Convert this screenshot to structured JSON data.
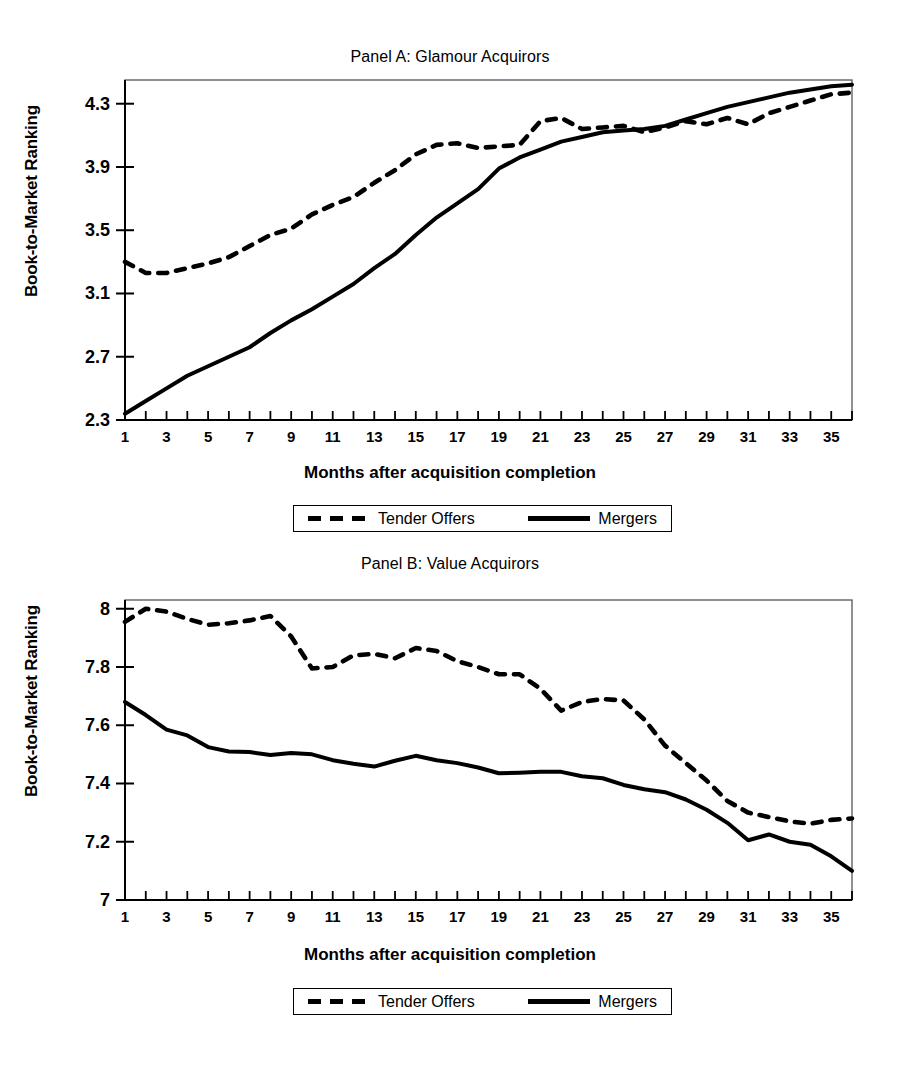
{
  "figure": {
    "legend": {
      "tender_label": "Tender Offers",
      "mergers_label": "Mergers"
    }
  },
  "chart_data": [
    {
      "type": "line",
      "panel": "A",
      "title": "Panel A: Glamour Acquirors",
      "xlabel": "Months after acquisition completion",
      "ylabel": "Book-to-Market Ranking",
      "xlim": [
        1,
        36
      ],
      "ylim": [
        2.3,
        4.45
      ],
      "yticks": [
        2.3,
        2.7,
        3.1,
        3.5,
        3.9,
        4.3
      ],
      "ytick_labels": [
        "2.3",
        "2.7",
        "3.1",
        "3.5",
        "3.9",
        "4.3"
      ],
      "xticks": [
        1,
        2,
        3,
        4,
        5,
        6,
        7,
        8,
        9,
        10,
        11,
        12,
        13,
        14,
        15,
        16,
        17,
        18,
        19,
        20,
        21,
        22,
        23,
        24,
        25,
        26,
        27,
        28,
        29,
        30,
        31,
        32,
        33,
        34,
        35,
        36
      ],
      "xtick_labels": [
        "1",
        "",
        "3",
        "",
        "5",
        "",
        "7",
        "",
        "9",
        "",
        "11",
        "",
        "13",
        "",
        "15",
        "",
        "17",
        "",
        "19",
        "",
        "21",
        "",
        "23",
        "",
        "25",
        "",
        "27",
        "",
        "29",
        "",
        "31",
        "",
        "33",
        "",
        "35",
        ""
      ],
      "grid": false,
      "legend_position": "below",
      "x": [
        1,
        2,
        3,
        4,
        5,
        6,
        7,
        8,
        9,
        10,
        11,
        12,
        13,
        14,
        15,
        16,
        17,
        18,
        19,
        20,
        21,
        22,
        23,
        24,
        25,
        26,
        27,
        28,
        29,
        30,
        31,
        32,
        33,
        34,
        35,
        36
      ],
      "series": [
        {
          "name": "Tender Offers",
          "style": "dashed",
          "values": [
            3.3,
            3.23,
            3.23,
            3.26,
            3.29,
            3.33,
            3.4,
            3.47,
            3.51,
            3.6,
            3.66,
            3.71,
            3.8,
            3.88,
            3.98,
            4.04,
            4.05,
            4.02,
            4.03,
            4.04,
            4.19,
            4.21,
            4.14,
            4.15,
            4.16,
            4.12,
            4.15,
            4.19,
            4.17,
            4.21,
            4.17,
            4.24,
            4.28,
            4.32,
            4.36,
            4.37
          ]
        },
        {
          "name": "Mergers",
          "style": "solid",
          "values": [
            2.34,
            2.42,
            2.5,
            2.58,
            2.64,
            2.7,
            2.76,
            2.85,
            2.93,
            3.0,
            3.08,
            3.16,
            3.26,
            3.35,
            3.47,
            3.58,
            3.67,
            3.76,
            3.89,
            3.96,
            4.01,
            4.06,
            4.09,
            4.12,
            4.13,
            4.14,
            4.16,
            4.2,
            4.24,
            4.28,
            4.31,
            4.34,
            4.37,
            4.39,
            4.41,
            4.42
          ]
        }
      ]
    },
    {
      "type": "line",
      "panel": "B",
      "title": "Panel B: Value Acquirors",
      "xlabel": "Months after acquisition completion",
      "ylabel": "Book-to-Market Ranking",
      "xlim": [
        1,
        36
      ],
      "ylim": [
        7.0,
        8.03
      ],
      "yticks": [
        7.0,
        7.2,
        7.4,
        7.6,
        7.8,
        8.0
      ],
      "ytick_labels": [
        "7",
        "7.2",
        "7.4",
        "7.6",
        "7.8",
        "8"
      ],
      "xticks": [
        1,
        2,
        3,
        4,
        5,
        6,
        7,
        8,
        9,
        10,
        11,
        12,
        13,
        14,
        15,
        16,
        17,
        18,
        19,
        20,
        21,
        22,
        23,
        24,
        25,
        26,
        27,
        28,
        29,
        30,
        31,
        32,
        33,
        34,
        35,
        36
      ],
      "xtick_labels": [
        "1",
        "",
        "3",
        "",
        "5",
        "",
        "7",
        "",
        "9",
        "",
        "11",
        "",
        "13",
        "",
        "15",
        "",
        "17",
        "",
        "19",
        "",
        "21",
        "",
        "23",
        "",
        "25",
        "",
        "27",
        "",
        "29",
        "",
        "31",
        "",
        "33",
        "",
        "35",
        ""
      ],
      "grid": false,
      "legend_position": "below",
      "x": [
        1,
        2,
        3,
        4,
        5,
        6,
        7,
        8,
        9,
        10,
        11,
        12,
        13,
        14,
        15,
        16,
        17,
        18,
        19,
        20,
        21,
        22,
        23,
        24,
        25,
        26,
        27,
        28,
        29,
        30,
        31,
        32,
        33,
        34,
        35,
        36
      ],
      "series": [
        {
          "name": "Tender Offers",
          "style": "dashed",
          "values": [
            7.955,
            8.0,
            7.99,
            7.965,
            7.945,
            7.95,
            7.96,
            7.975,
            7.905,
            7.795,
            7.8,
            7.84,
            7.845,
            7.83,
            7.865,
            7.855,
            7.82,
            7.8,
            7.775,
            7.775,
            7.725,
            7.65,
            7.68,
            7.69,
            7.685,
            7.62,
            7.53,
            7.47,
            7.41,
            7.34,
            7.3,
            7.285,
            7.27,
            7.262,
            7.275,
            7.28
          ]
        },
        {
          "name": "Mergers",
          "style": "solid",
          "values": [
            7.68,
            7.635,
            7.585,
            7.565,
            7.525,
            7.51,
            7.508,
            7.498,
            7.505,
            7.5,
            7.48,
            7.468,
            7.458,
            7.478,
            7.495,
            7.48,
            7.47,
            7.455,
            7.435,
            7.437,
            7.44,
            7.44,
            7.425,
            7.418,
            7.395,
            7.38,
            7.37,
            7.345,
            7.31,
            7.265,
            7.205,
            7.225,
            7.2,
            7.19,
            7.15,
            7.1
          ]
        }
      ]
    }
  ]
}
